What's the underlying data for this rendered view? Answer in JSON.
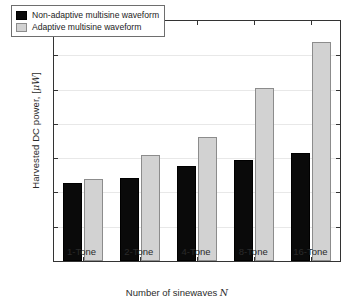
{
  "chart_data": {
    "type": "bar",
    "title": "",
    "categories": [
      "1-Tone",
      "2-Tone",
      "4-Tone",
      "8-Tone",
      "16-Tone"
    ],
    "series": [
      {
        "name": "Non-adaptive multisine waveform",
        "color": "#0a0a0a",
        "values": [
          1.14,
          1.21,
          1.38,
          1.48,
          1.57
        ]
      },
      {
        "name": "Adaptive multisine waveform",
        "color": "#d2d2d2",
        "values": [
          1.19,
          1.55,
          1.81,
          2.53,
          3.2
        ]
      }
    ],
    "xlabel": "Number of sinewaves N",
    "ylabel": "Harvested DC power, [μW]",
    "ylim": [
      0,
      3.5
    ],
    "yticks": [
      "0",
      "0.5",
      "1",
      "1.5",
      "2",
      "2.5",
      "3",
      "3.5"
    ],
    "ytick_values": [
      0,
      0.5,
      1,
      1.5,
      2,
      2.5,
      3,
      3.5
    ],
    "grid": true,
    "legend_position": "top-left"
  },
  "axes": {
    "ylabel_pre": "Harvested DC power, [",
    "ylabel_mu": "μW",
    "ylabel_post": "]",
    "xlabel_pre": "Number of sinewaves ",
    "xlabel_var": "N"
  },
  "legend": {
    "items": [
      {
        "label": "Non-adaptive multisine waveform",
        "swatch": "black-swatch"
      },
      {
        "label": "Adaptive multisine waveform",
        "swatch": "gray-swatch"
      }
    ]
  }
}
